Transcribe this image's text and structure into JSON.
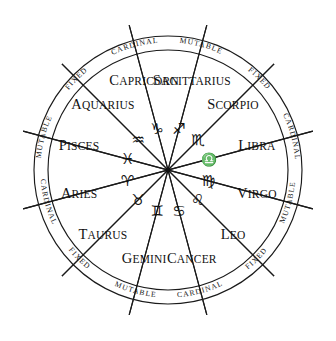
{
  "diagram": {
    "geometry": {
      "center_x": 168,
      "center_y": 170,
      "outer_radius": 134,
      "inner_radius": 120,
      "spokes": 12,
      "segment_degrees": 30
    },
    "colors": {
      "line": "#1a1a1a",
      "text": "#111111",
      "background": "#ffffff"
    }
  },
  "signs": [
    {
      "name": "Capricorn",
      "initial": "C",
      "rest": "APRICORN",
      "glyph": "♑",
      "quality": "Cardinal",
      "name_angle": -105,
      "name_radius": 92,
      "glyph_angle": -105,
      "glyph_radius": 42
    },
    {
      "name": "Sagittarius",
      "initial": "S",
      "rest": "AGITTARIUS",
      "glyph": "♐",
      "quality": "Mutable",
      "name_angle": -75,
      "name_radius": 92,
      "glyph_angle": -75,
      "glyph_radius": 42
    },
    {
      "name": "Scorpio",
      "initial": "S",
      "rest": "CORPIO",
      "glyph": "♏",
      "quality": "Fixed",
      "name_angle": -45,
      "name_radius": 92,
      "glyph_angle": -45,
      "glyph_radius": 42
    },
    {
      "name": "Libra",
      "initial": "L",
      "rest": "IBRA",
      "glyph": "♎",
      "quality": "Cardinal",
      "name_angle": -15,
      "name_radius": 92,
      "glyph_angle": -15,
      "glyph_radius": 42
    },
    {
      "name": "Virgo",
      "initial": "V",
      "rest": "IRGO",
      "glyph": "♍",
      "quality": "Mutable",
      "name_angle": 15,
      "name_radius": 92,
      "glyph_angle": 15,
      "glyph_radius": 42
    },
    {
      "name": "Leo",
      "initial": "L",
      "rest": "EO",
      "glyph": "♌",
      "quality": "Fixed",
      "name_angle": 45,
      "name_radius": 92,
      "glyph_angle": 45,
      "glyph_radius": 42
    },
    {
      "name": "Cancer",
      "initial": "C",
      "rest": "ANCER",
      "glyph": "♋",
      "quality": "Cardinal",
      "name_angle": 75,
      "name_radius": 92,
      "glyph_angle": 75,
      "glyph_radius": 42
    },
    {
      "name": "Gemini",
      "initial": "G",
      "rest": "EMINI",
      "glyph": "♊",
      "quality": "Mutable",
      "name_angle": 105,
      "name_radius": 92,
      "glyph_angle": 105,
      "glyph_radius": 42
    },
    {
      "name": "Taurus",
      "initial": "T",
      "rest": "AURUS",
      "glyph": "♉",
      "quality": "Fixed",
      "name_angle": 135,
      "name_radius": 92,
      "glyph_angle": 135,
      "glyph_radius": 42
    },
    {
      "name": "Aries",
      "initial": "A",
      "rest": "RIES",
      "glyph": "♈",
      "quality": "Cardinal",
      "name_angle": 165,
      "name_radius": 92,
      "glyph_angle": 165,
      "glyph_radius": 42
    },
    {
      "name": "Pisces",
      "initial": "P",
      "rest": "ISCES",
      "glyph": "♓",
      "quality": "Mutable",
      "name_angle": 195,
      "name_radius": 92,
      "glyph_angle": 195,
      "glyph_radius": 42
    },
    {
      "name": "Aquarius",
      "initial": "A",
      "rest": "QUARIUS",
      "glyph": "♒",
      "quality": "Fixed",
      "name_angle": 225,
      "name_radius": 92,
      "glyph_angle": 225,
      "glyph_radius": 42
    }
  ],
  "qualities": [
    {
      "label": "CARDINAL",
      "angle": -105
    },
    {
      "label": "MUTABLE",
      "angle": -75
    },
    {
      "label": "FIXED",
      "angle": -45
    },
    {
      "label": "CARDINAL",
      "angle": -15
    },
    {
      "label": "MUTABLE",
      "angle": 15
    },
    {
      "label": "FIXED",
      "angle": 45
    },
    {
      "label": "CARDINAL",
      "angle": 75
    },
    {
      "label": "MUTABLE",
      "angle": 105
    },
    {
      "label": "FIXED",
      "angle": 135
    },
    {
      "label": "CARDINAL",
      "angle": 165
    },
    {
      "label": "MUTABLE",
      "angle": 195
    },
    {
      "label": "FIXED",
      "angle": 225
    }
  ]
}
